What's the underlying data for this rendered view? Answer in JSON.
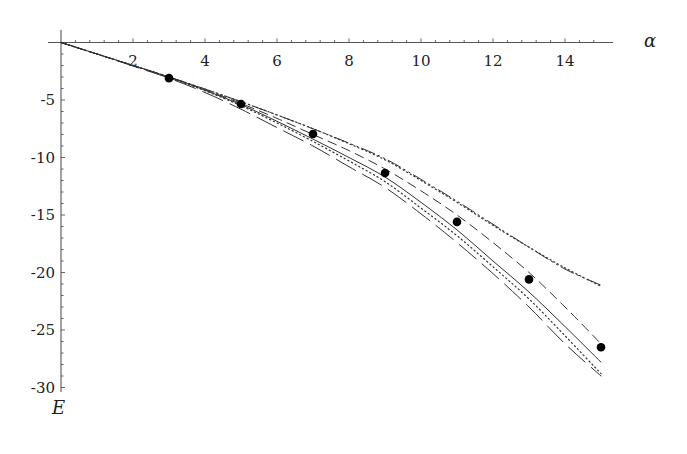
{
  "chart_data": {
    "type": "line",
    "title": "",
    "xlabel": "α",
    "ylabel": "E",
    "xlim": [
      0,
      15.3
    ],
    "ylim": [
      -30.5,
      0
    ],
    "grid": false,
    "legend": null,
    "x_ticks": [
      2,
      4,
      6,
      8,
      10,
      12,
      14
    ],
    "x_tick_labels": [
      "2",
      "4",
      "6",
      "8",
      "10",
      "12",
      "14"
    ],
    "y_ticks": [
      -5,
      -10,
      -15,
      -20,
      -25,
      -30
    ],
    "y_tick_labels": [
      "-5",
      "-10",
      "-15",
      "-20",
      "-25",
      "-30"
    ],
    "x": [
      0,
      1,
      2,
      3,
      4,
      5,
      6,
      7,
      8,
      9,
      10,
      11,
      12,
      13,
      14,
      15
    ],
    "series": [
      {
        "name": "upper-dotted",
        "style": "dotted",
        "values": [
          0,
          -1.0,
          -2.0,
          -3.0,
          -4.05,
          -5.15,
          -6.3,
          -7.5,
          -8.8,
          -10.2,
          -12.0,
          -13.9,
          -15.9,
          -17.8,
          -19.6,
          -21.2
        ]
      },
      {
        "name": "upper-dash-dot",
        "style": "dashdot",
        "values": [
          0,
          -1.0,
          -2.0,
          -3.0,
          -4.05,
          -5.15,
          -6.3,
          -7.5,
          -8.75,
          -10.1,
          -11.9,
          -13.8,
          -15.8,
          -17.8,
          -19.7,
          -21.1
        ]
      },
      {
        "name": "dashed",
        "style": "dashed",
        "values": [
          0,
          -1.0,
          -2.0,
          -3.0,
          -4.1,
          -5.3,
          -6.6,
          -8.0,
          -9.4,
          -11.0,
          -12.9,
          -15.0,
          -17.4,
          -20.0,
          -23.0,
          -26.2
        ]
      },
      {
        "name": "solid",
        "style": "solid",
        "values": [
          0,
          -1.0,
          -2.0,
          -3.0,
          -4.15,
          -5.4,
          -6.85,
          -8.4,
          -10.0,
          -11.7,
          -13.9,
          -16.3,
          -19.0,
          -21.7,
          -24.7,
          -27.8
        ]
      },
      {
        "name": "lower-dotted",
        "style": "dotted",
        "values": [
          0,
          -1.0,
          -2.0,
          -3.05,
          -4.2,
          -5.5,
          -7.0,
          -8.6,
          -10.3,
          -12.1,
          -14.4,
          -16.8,
          -19.5,
          -22.3,
          -25.5,
          -28.8
        ]
      },
      {
        "name": "long-dashed",
        "style": "longdash",
        "values": [
          0,
          -1.0,
          -2.05,
          -3.1,
          -4.35,
          -5.8,
          -7.4,
          -9.0,
          -10.8,
          -12.6,
          -14.9,
          -17.4,
          -20.1,
          -23.0,
          -26.2,
          -29.0
        ]
      }
    ],
    "points": {
      "name": "data-points",
      "marker": "filled-circle",
      "x": [
        3,
        5,
        7,
        9,
        11,
        13,
        15
      ],
      "y": [
        -3.1,
        -5.35,
        -7.95,
        -11.35,
        -15.6,
        -20.6,
        -26.5
      ]
    }
  },
  "colors": {
    "axis": "#555555",
    "line": "#333333",
    "point": "#000000",
    "background": "#ffffff"
  }
}
